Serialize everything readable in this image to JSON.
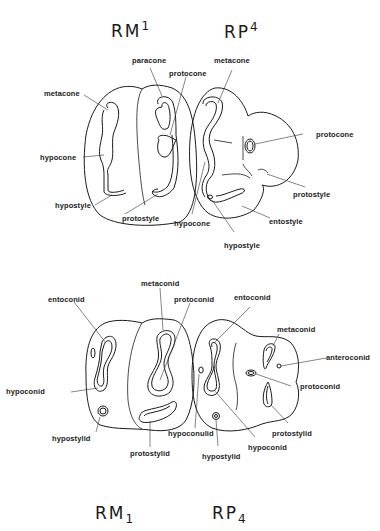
{
  "upper": {
    "title_left": {
      "base": "RM",
      "sup": "1"
    },
    "title_right": {
      "base": "RP",
      "sup": "4"
    },
    "labels": {
      "paracone": "paracone",
      "protocone_m1": "protocone",
      "metacone_p4": "metacone",
      "metacone_m1": "metacone",
      "protocone_p4": "protocone",
      "hypocone_m1": "hypocone",
      "protostyle_p4": "protostyle",
      "hypostyle_m1": "hypostyle",
      "protostyle_m1": "protostyle",
      "hypocone_p4": "hypocone",
      "entostyle_p4": "entostyle",
      "hypostyle_p4": "hypostyle"
    }
  },
  "lower": {
    "title_left": {
      "base": "RM",
      "sub": "1"
    },
    "title_right": {
      "base": "RP",
      "sub": "4"
    },
    "labels": {
      "metaconid_m1": "metaconid",
      "entoconid_m1": "entoconid",
      "protoconid_m1": "protoconid",
      "entoconid_p4": "entoconid",
      "metaconid_p4": "metaconid",
      "anteroconid_p4": "anteroconid",
      "hypoconid_m1": "hypoconid",
      "protoconid_p4": "protoconid",
      "protostylid_p4": "protostylid",
      "hypostylid_m1": "hypostylid",
      "hypoconulid_p4": "hypoconulid",
      "hypoconid_p4": "hypoconid",
      "protostylid_m1": "protostylid",
      "hypostylid_p4": "hypostylid"
    }
  }
}
